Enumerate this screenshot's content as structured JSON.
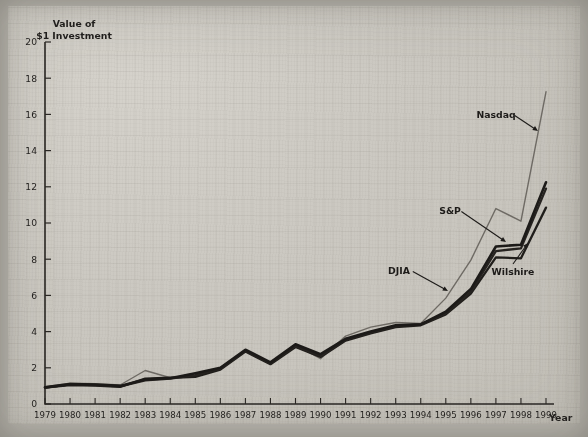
{
  "figure": {
    "y_axis_title_line1": "Value of",
    "y_axis_title_line2": "$1 Investment",
    "x_axis_title": "Year"
  },
  "chart_data": {
    "type": "line",
    "title": "",
    "subtitle": "",
    "xlabel": "Year",
    "ylabel": "Value of $1 Investment",
    "x": [
      1979,
      1980,
      1981,
      1982,
      1983,
      1984,
      1985,
      1986,
      1987,
      1988,
      1989,
      1990,
      1991,
      1992,
      1993,
      1994,
      1995,
      1996,
      1997,
      1998,
      1999
    ],
    "xlim": [
      1979,
      1999
    ],
    "ylim": [
      0,
      20
    ],
    "ytick_values": [
      0,
      2,
      4,
      6,
      8,
      10,
      12,
      14,
      16,
      18,
      20
    ],
    "xtick_labels": [
      "1979",
      "1980",
      "1981",
      "1982",
      "1983",
      "1984",
      "1985",
      "1986",
      "1987",
      "1988",
      "1989",
      "1990",
      "1991",
      "1992",
      "1993",
      "1994",
      "1995",
      "1996",
      "1997",
      "1998",
      "1999"
    ],
    "grid": false,
    "legend_position": "inline-annotations",
    "series": [
      {
        "name": "Nasdaq",
        "color": "#6e6a64",
        "width": 1.4,
        "values": [
          0.95,
          1.15,
          1.12,
          1.05,
          1.85,
          1.45,
          1.55,
          2.0,
          3.0,
          2.25,
          3.25,
          2.5,
          3.75,
          4.25,
          4.5,
          4.45,
          5.85,
          7.95,
          10.8,
          10.1,
          17.25
        ]
      },
      {
        "name": "S&P",
        "color": "#1c1a18",
        "width": 2.6,
        "values": [
          0.92,
          1.1,
          1.08,
          1.0,
          1.35,
          1.42,
          1.7,
          2.0,
          3.0,
          2.3,
          3.3,
          2.75,
          3.6,
          4.0,
          4.35,
          4.4,
          5.1,
          6.35,
          8.7,
          8.8,
          12.25
        ]
      },
      {
        "name": "DJIA",
        "color": "#262320",
        "width": 2.3,
        "values": [
          0.9,
          1.08,
          1.05,
          0.98,
          1.3,
          1.4,
          1.6,
          1.95,
          2.95,
          2.25,
          3.2,
          2.65,
          3.55,
          3.95,
          4.3,
          4.4,
          5.0,
          6.2,
          8.45,
          8.6,
          11.9
        ]
      },
      {
        "name": "Wilshire",
        "color": "#201e1b",
        "width": 2.3,
        "values": [
          0.9,
          1.05,
          1.02,
          0.95,
          1.4,
          1.45,
          1.5,
          1.9,
          2.9,
          2.2,
          3.15,
          2.6,
          3.5,
          3.9,
          4.25,
          4.35,
          4.95,
          6.1,
          8.1,
          8.05,
          10.85
        ]
      }
    ],
    "annotations": [
      {
        "label": "Nasdaq",
        "text_x": 496,
        "text_y": 118,
        "arrow_to_x": 538,
        "arrow_to_y": 131
      },
      {
        "label": "S&P",
        "text_x": 450,
        "text_y": 214,
        "arrow_to_x": 506,
        "arrow_to_y": 242
      },
      {
        "label": "DJIA",
        "text_x": 399,
        "text_y": 274,
        "arrow_to_x": 448,
        "arrow_to_y": 291
      },
      {
        "label": "Wilshire",
        "text_x": 513,
        "text_y": 275,
        "arrow_to_x": 528,
        "arrow_to_y": 243
      }
    ]
  }
}
